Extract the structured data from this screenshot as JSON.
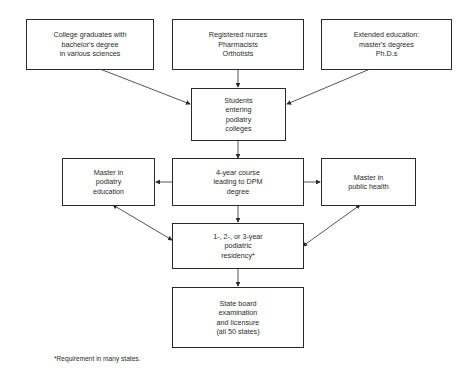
{
  "diagram": {
    "nodes": {
      "college_graduates": "College graduates with\nbachelor's degree\nin various sciences",
      "health_professionals": "Registered nurses\nPharmacists\nOrthotists",
      "extended_education": "Extended education:\nmaster's degrees\nPh.D.s",
      "students_entering": "Students\nentering\npodiatry\ncolleges",
      "four_year_course": "4-year course\nleading to DPM\ndegree",
      "master_podiatry_education": "Master in\npodiatry\neducation",
      "master_public_health": "Master in\npublic health",
      "residency": "1-, 2-, or 3-year\npodiatric\nresidency*",
      "state_board": "State board\nexamination\nand licensure\n(all 50 states)"
    },
    "edges": [
      {
        "from": "college_graduates",
        "to": "students_entering"
      },
      {
        "from": "health_professionals",
        "to": "students_entering"
      },
      {
        "from": "extended_education",
        "to": "students_entering"
      },
      {
        "from": "students_entering",
        "to": "four_year_course"
      },
      {
        "from": "four_year_course",
        "to": "master_podiatry_education"
      },
      {
        "from": "four_year_course",
        "to": "master_public_health"
      },
      {
        "from": "four_year_course",
        "to": "residency"
      },
      {
        "from": "master_podiatry_education",
        "to": "residency",
        "bidirectional": true
      },
      {
        "from": "master_public_health",
        "to": "residency",
        "bidirectional": true
      },
      {
        "from": "residency",
        "to": "state_board"
      }
    ],
    "footnote": "*Requirement in many states."
  }
}
